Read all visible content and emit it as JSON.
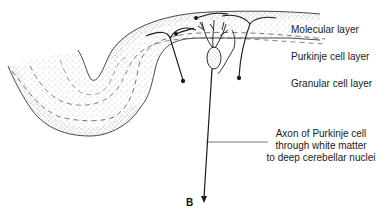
{
  "diagram": {
    "panel_label": "B",
    "layers": [
      {
        "name": "Molecular layer"
      },
      {
        "name": "Purkinje cell layer"
      },
      {
        "name": "Granular cell layer"
      }
    ],
    "axon_annotation": {
      "lines": [
        "Axon of Purkinje cell",
        "through white matter",
        "to deep cerebellar nuclei"
      ]
    },
    "colors": {
      "line": "#1a1a1a",
      "stipple": "#6e6e6e",
      "background": "#ffffff"
    }
  }
}
